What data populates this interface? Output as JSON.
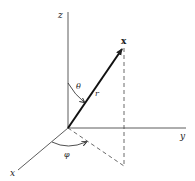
{
  "figure": {
    "type": "spherical-coordinates",
    "labels": {
      "z_axis": "z",
      "y_axis": "y",
      "x_axis": "x",
      "vector": "x",
      "radius": "r",
      "polar_angle": "θ",
      "azimuth_angle": "φ"
    },
    "colors": {
      "line": "#222222",
      "background": "#ffffff"
    }
  }
}
